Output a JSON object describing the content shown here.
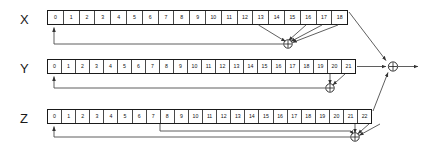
{
  "diagram": {
    "output_label": "",
    "xor_glyph": "+",
    "wire_color": "#4d4d4d",
    "border_color": "#1a1a1a",
    "background": "#ffffff"
  },
  "registers": [
    {
      "id": "x",
      "label": "X",
      "length": 19,
      "cells": [
        "0",
        "1",
        "2",
        "3",
        "4",
        "5",
        "6",
        "7",
        "8",
        "9",
        "10",
        "11",
        "12",
        "13",
        "14",
        "15",
        "16",
        "17",
        "18"
      ],
      "taps": [
        "13",
        "16",
        "17",
        "18"
      ],
      "feedback_target": "0",
      "output_cell": "18"
    },
    {
      "id": "y",
      "label": "Y",
      "length": 22,
      "cells": [
        "0",
        "1",
        "2",
        "3",
        "4",
        "5",
        "6",
        "7",
        "8",
        "9",
        "10",
        "11",
        "12",
        "13",
        "14",
        "15",
        "16",
        "17",
        "18",
        "19",
        "20",
        "21"
      ],
      "taps": [
        "20",
        "21"
      ],
      "feedback_target": "0",
      "output_cell": "21"
    },
    {
      "id": "z",
      "label": "Z",
      "length": 23,
      "cells": [
        "0",
        "1",
        "2",
        "3",
        "4",
        "5",
        "6",
        "7",
        "8",
        "9",
        "10",
        "11",
        "12",
        "13",
        "14",
        "15",
        "16",
        "17",
        "18",
        "19",
        "20",
        "21",
        "22"
      ],
      "taps": [
        "7",
        "20",
        "21",
        "22"
      ],
      "feedback_target": "0",
      "output_cell": "22"
    }
  ],
  "xor_gates": [
    {
      "id": "xor-x",
      "name": "x-feedback-xor"
    },
    {
      "id": "xor-y",
      "name": "y-feedback-xor"
    },
    {
      "id": "xor-z",
      "name": "z-feedback-xor"
    },
    {
      "id": "xor-out",
      "name": "keystream-output-xor"
    }
  ]
}
